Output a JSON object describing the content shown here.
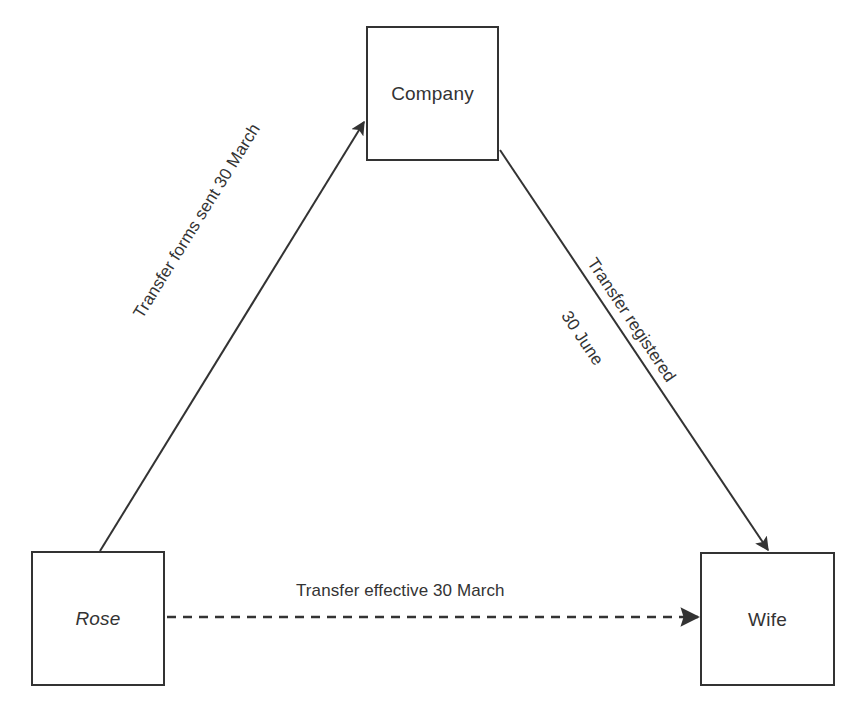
{
  "diagram": {
    "type": "flow-diagram",
    "background_color": "#ffffff",
    "line_color": "#333333",
    "text_color": "#333333",
    "nodes": [
      {
        "id": "company",
        "label": "Company",
        "style": "normal",
        "x": 366,
        "y": 26,
        "width": 133,
        "height": 135
      },
      {
        "id": "rose",
        "label": "Rose",
        "style": "italic",
        "x": 31,
        "y": 551,
        "width": 134,
        "height": 135
      },
      {
        "id": "wife",
        "label": "Wife",
        "style": "normal",
        "x": 700,
        "y": 552,
        "width": 135,
        "height": 134
      }
    ],
    "edges": [
      {
        "id": "rose-to-company",
        "from": "rose",
        "to": "company",
        "style": "solid",
        "arrow": "single",
        "label": "Transfer forms sent 30 March",
        "label_lines": [
          "Transfer forms sent 30 March"
        ]
      },
      {
        "id": "company-to-wife",
        "from": "company",
        "to": "wife",
        "style": "solid",
        "arrow": "single",
        "label": "Transfer registered 30 June",
        "label_lines": [
          "Transfer registered",
          "30 June"
        ]
      },
      {
        "id": "rose-to-wife",
        "from": "rose",
        "to": "wife",
        "style": "dashed",
        "arrow": "single",
        "label": "Transfer effective 30 March",
        "label_lines": [
          "Transfer effective 30 March"
        ]
      }
    ]
  }
}
